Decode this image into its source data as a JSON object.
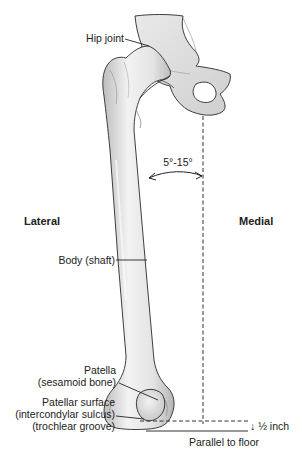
{
  "diagram": {
    "colors": {
      "bone_fill": "#ebebeb",
      "bone_shade": "#c9c9c9",
      "outline": "#2a2a2a",
      "text": "#222222",
      "background": "#ffffff"
    },
    "orientation_labels": {
      "lateral": "Lateral",
      "medial": "Medial"
    },
    "labels": {
      "hip_joint": "Hip joint",
      "body_shaft": "Body (shaft)",
      "patella_line1": "Patella",
      "patella_line2": "(sesamoid bone)",
      "patellar_surface_line1": "Patellar surface",
      "patellar_surface_line2": "(intercondylar sulcus)",
      "patellar_surface_line3": "(trochlear groove)"
    },
    "measurements": {
      "angle": "5°-15°",
      "offset": "½ inch",
      "offset_arrow": "↓",
      "reference_line": "Parallel to floor"
    }
  }
}
